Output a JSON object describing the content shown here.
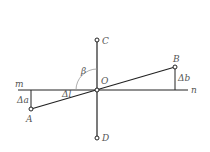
{
  "diagram": {
    "labels": {
      "C": "C",
      "D": "D",
      "O": "O",
      "A": "A",
      "B": "B",
      "m": "m",
      "n": "n",
      "delta_a": "Δa",
      "delta_b": "Δb",
      "beta": "β",
      "alpha": "Δl"
    },
    "colors": {
      "line": "#222222",
      "arc": "#999999",
      "text": "#555555"
    }
  }
}
